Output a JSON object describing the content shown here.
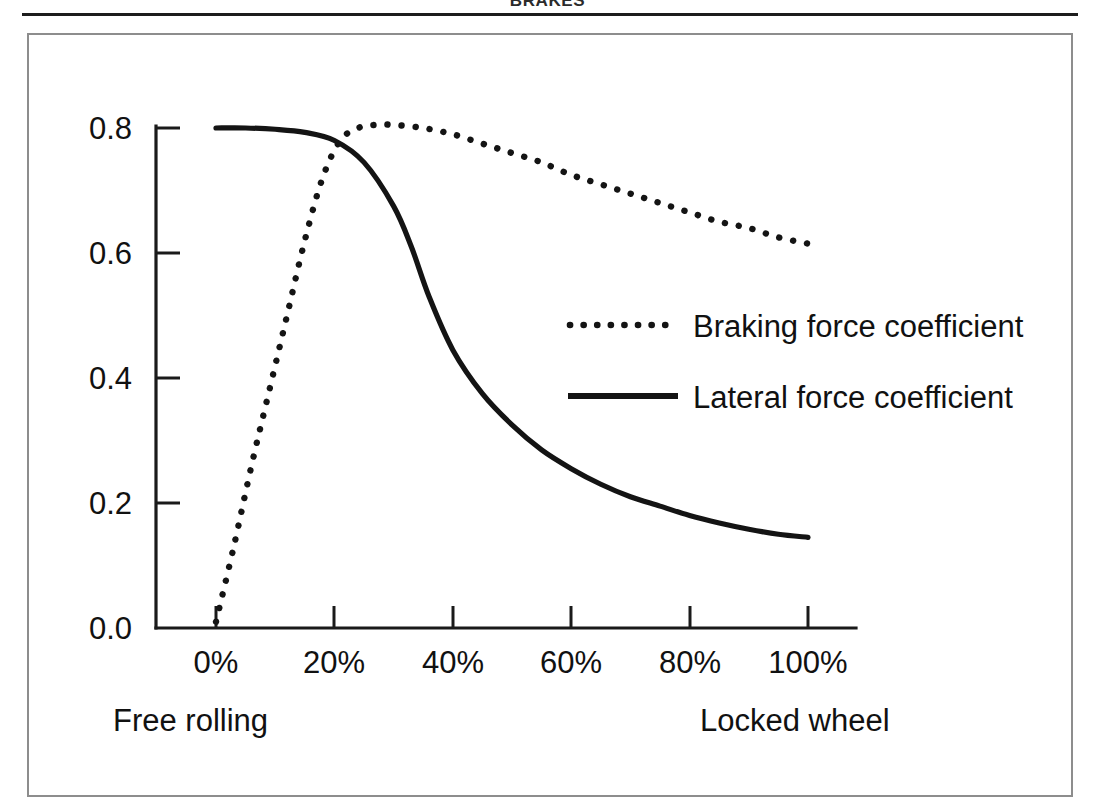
{
  "header": {
    "title": "BRAKES"
  },
  "chart_data": {
    "type": "line",
    "title": "",
    "subtitle": "",
    "xlabel": "",
    "ylabel": "",
    "xlim": [
      0,
      100
    ],
    "ylim": [
      0.0,
      0.8
    ],
    "grid": false,
    "legend_position": "center-right",
    "x_tick_labels": [
      "0%",
      "20%",
      "40%",
      "60%",
      "80%",
      "100%"
    ],
    "x_tick_values": [
      0,
      20,
      40,
      60,
      80,
      100
    ],
    "y_tick_labels": [
      "0.0",
      "0.2",
      "0.4",
      "0.6",
      "0.8"
    ],
    "y_tick_values": [
      0.0,
      0.2,
      0.4,
      0.6,
      0.8
    ],
    "axis_annotations": {
      "left": "Free rolling",
      "right": "Locked wheel"
    },
    "series": [
      {
        "name": "Braking force coefficient",
        "style": "dotted",
        "color": "#141414",
        "x": [
          0,
          3,
          6,
          9,
          12,
          15,
          18,
          21,
          24,
          27,
          30,
          35,
          40,
          45,
          50,
          55,
          60,
          65,
          70,
          75,
          80,
          85,
          90,
          95,
          100
        ],
        "y": [
          0.01,
          0.13,
          0.26,
          0.38,
          0.5,
          0.62,
          0.72,
          0.78,
          0.8,
          0.805,
          0.805,
          0.8,
          0.79,
          0.775,
          0.76,
          0.745,
          0.725,
          0.71,
          0.695,
          0.68,
          0.665,
          0.65,
          0.64,
          0.625,
          0.615
        ]
      },
      {
        "name": "Lateral force coefficient",
        "style": "solid",
        "color": "#141414",
        "x": [
          0,
          5,
          10,
          15,
          20,
          25,
          30,
          33,
          36,
          40,
          45,
          50,
          55,
          60,
          65,
          70,
          75,
          80,
          85,
          90,
          95,
          100
        ],
        "y": [
          0.8,
          0.8,
          0.798,
          0.793,
          0.78,
          0.745,
          0.675,
          0.61,
          0.53,
          0.445,
          0.375,
          0.325,
          0.285,
          0.255,
          0.23,
          0.21,
          0.195,
          0.18,
          0.168,
          0.158,
          0.15,
          0.145
        ]
      }
    ],
    "legend": [
      {
        "label": "Braking force coefficient",
        "style": "dotted"
      },
      {
        "label": "Lateral force coefficient",
        "style": "solid"
      }
    ]
  }
}
